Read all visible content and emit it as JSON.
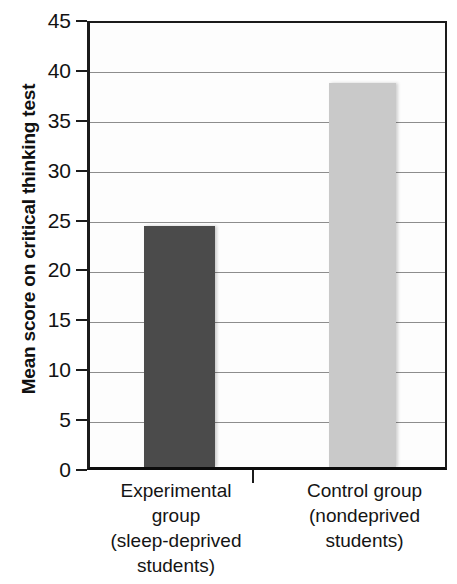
{
  "chart_data": {
    "type": "bar",
    "title": "",
    "subtitle": "",
    "xlabel": "",
    "ylabel": "Mean score on critical thinking test",
    "ylim": [
      0,
      45
    ],
    "ytick_interval": 5,
    "yticks": [
      45,
      40,
      35,
      30,
      25,
      20,
      15,
      10,
      5,
      0
    ],
    "grid": true,
    "legend": "none",
    "categories": [
      "Experimental group (sleep-deprived students)",
      "Control group (nondeprived students)"
    ],
    "category_lines": [
      [
        "Experimental",
        "group",
        "(sleep-deprived",
        "students)"
      ],
      [
        "Control group",
        "(nondeprived",
        "students)"
      ]
    ],
    "values": [
      24.5,
      38.8
    ],
    "bar_colors": [
      "#4b4b4b",
      "#c9c9c9"
    ],
    "series": [
      {
        "name": "Mean score on critical thinking test",
        "values": [
          24.5,
          38.8
        ]
      }
    ]
  },
  "axis": {
    "y_title": "Mean score on critical thinking test",
    "tick_labels": [
      "45",
      "40",
      "35",
      "30",
      "25",
      "20",
      "15",
      "10",
      "5",
      "0"
    ]
  },
  "colors": {
    "experimental_bar": "#4b4b4b",
    "control_bar": "#c9c9c9",
    "axis_line": "#1b1b1b",
    "gridline": "#8d8d8d",
    "background": "#ffffff",
    "text": "#141414"
  }
}
